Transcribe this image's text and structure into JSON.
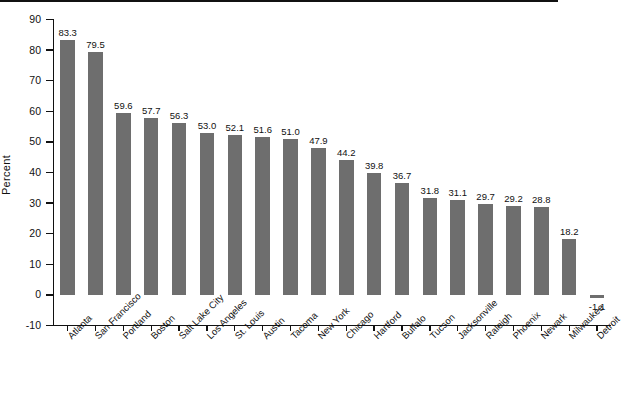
{
  "chart_data": {
    "type": "bar",
    "title": "",
    "subtitle": "",
    "xlabel": "",
    "ylabel": "Percent",
    "ylim": [
      -10,
      90
    ],
    "ytick_step": 10,
    "yticks": [
      90,
      80,
      70,
      60,
      50,
      40,
      30,
      20,
      10,
      0,
      -10
    ],
    "ytick_labels": [
      "90",
      "80",
      "70",
      "60",
      "50",
      "40",
      "30",
      "20",
      "10",
      "0",
      "-10"
    ],
    "grid": false,
    "legend": null,
    "bar_color": "#6e6e6e",
    "axis_color": "#111111",
    "background_color": "#ffffff",
    "value_label_format": "one-decimal",
    "categories": [
      "Atlanta",
      "San Francisco",
      "Portland",
      "Boston",
      "Salt Lake City",
      "Los Angeles",
      "St. Louis",
      "Austin",
      "Tacoma",
      "New York",
      "Chicago",
      "Hartford",
      "Buffalo",
      "Tucson",
      "Jacksonville",
      "Raleigh",
      "Phoenix",
      "Newark",
      "Milwaukee",
      "Detroit"
    ],
    "values": [
      83.3,
      79.5,
      59.6,
      57.7,
      56.3,
      53.0,
      52.1,
      51.6,
      51.0,
      47.9,
      44.2,
      39.8,
      36.7,
      31.8,
      31.1,
      29.7,
      29.2,
      28.8,
      18.2,
      -1.1
    ],
    "value_labels": [
      "83.3",
      "79.5",
      "59.6",
      "57.7",
      "56.3",
      "53.0",
      "52.1",
      "51.6",
      "51.0",
      "47.9",
      "44.2",
      "39.8",
      "36.7",
      "31.8",
      "31.1",
      "29.7",
      "29.2",
      "28.8",
      "18.2",
      "-1.1"
    ]
  }
}
